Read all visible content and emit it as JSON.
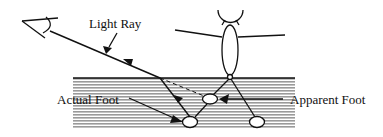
{
  "diagram": {
    "labels": {
      "light_ray": "Light Ray",
      "actual_foot": "Actual Foot",
      "apparent_foot": "Apparent Foot"
    },
    "colors": {
      "ink": "#111111",
      "water_stripe": "#9a9a9a",
      "background": "#ffffff"
    },
    "icons": {
      "eye": "eye-icon",
      "person": "stick-figure"
    }
  }
}
